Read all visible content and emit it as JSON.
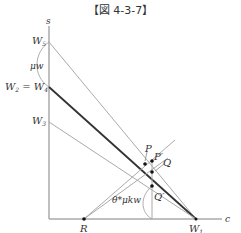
{
  "figure": {
    "title": "【図 4-3-7】"
  },
  "axes": {
    "y_label": "s",
    "x_label": "c"
  },
  "labels": {
    "w5": "W",
    "w5_sub": "5",
    "mu_w": "μw",
    "w2_eq_w4": "W",
    "w2_sub": "2",
    "eq": " = W",
    "w4_sub": "4",
    "w3": "W",
    "w3_sub": "3",
    "w1": "W",
    "w1_sub": "1",
    "r": "R",
    "p": "P",
    "p_prime": "P′",
    "q": "Q",
    "q_prime": "Q′",
    "theta_mu_k_w": "θ*μkw"
  },
  "colors": {
    "axis": "#aaaaaa",
    "bold_line": "#333333",
    "thin_line": "#aaaaaa",
    "point": "#111111"
  }
}
